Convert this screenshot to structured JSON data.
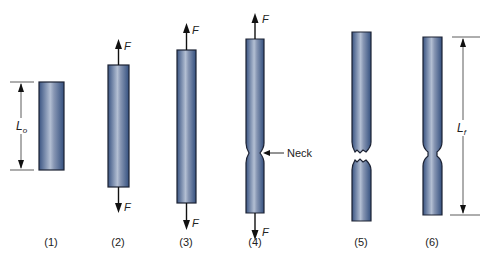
{
  "colors": {
    "specimen_dark": "#3f5a86",
    "specimen_light": "#a9b6cc",
    "outline": "#1c2233",
    "arrow": "#111111",
    "dimension_line": "#333333"
  },
  "labels": {
    "force": "F",
    "neck": "Neck",
    "original_length_main": "L",
    "original_length_sub": "o",
    "final_length_main": "L",
    "final_length_sub": "f"
  },
  "stages": [
    {
      "id": 1,
      "label": "(1)",
      "description": "Original specimen, gage length Lo"
    },
    {
      "id": 2,
      "label": "(2)",
      "description": "Uniform elongation under load F"
    },
    {
      "id": 3,
      "label": "(3)",
      "description": "Continued elongation under load F"
    },
    {
      "id": 4,
      "label": "(4)",
      "description": "Necking begins"
    },
    {
      "id": 5,
      "label": "(5)",
      "description": "Fracture"
    },
    {
      "id": 6,
      "label": "(6)",
      "description": "Final length Lf after fracture"
    }
  ]
}
